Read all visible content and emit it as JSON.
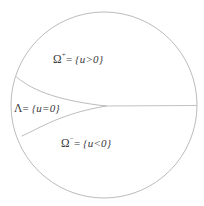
{
  "figure": {
    "type": "free-boundary-partition-diagram",
    "background_color": "#ffffff",
    "stroke_color": "#b9b9b9",
    "text_color": "#3a3a3a",
    "domain_boundary": {
      "shape": "circle",
      "center_x": 104,
      "center_y": 105,
      "radius": 93
    },
    "regions": [
      {
        "id": "omega-plus",
        "symbol": "Ω",
        "superscript": "+",
        "equals": "=",
        "set": "{u>0}",
        "position": "upper"
      },
      {
        "id": "lambda",
        "symbol": "Λ",
        "superscript": "",
        "equals": "=",
        "set": "{u=0}",
        "position": "middle-left"
      },
      {
        "id": "omega-minus",
        "symbol": "Ω",
        "superscript": "−",
        "equals": "=",
        "set": "{u<0}",
        "position": "lower"
      }
    ],
    "curves": [
      {
        "id": "upper-free-boundary",
        "description": "arc from left circle edge curving down-right to cusp"
      },
      {
        "id": "lower-free-boundary",
        "description": "arc from lower-left circle edge curving up-right to cusp"
      },
      {
        "id": "horizontal-branch",
        "description": "straight segment from cusp to right circle edge"
      }
    ],
    "cusp_point": {
      "x": 106,
      "y": 106
    }
  }
}
